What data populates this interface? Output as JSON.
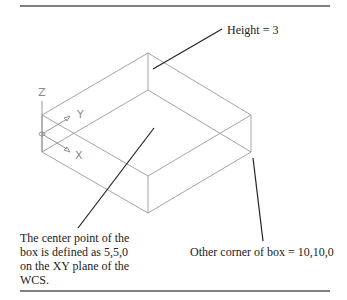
{
  "diagram": {
    "type": "isometric-box-wireframe",
    "colors": {
      "rule": "#555555",
      "box_edge": "#9a9a9a",
      "leader": "#222222",
      "axis": "#8a8a8a",
      "text": "#222222"
    },
    "ucs_icon": {
      "z_label": "Z",
      "y_label": "Y",
      "x_label": "X"
    },
    "annotations": {
      "height": "Height = 3",
      "center_line1": "The center point of the",
      "center_line2": "box is defined as 5,5,0",
      "center_line3": "on the XY plane of the",
      "center_line4": "WCS.",
      "other_corner": "Other corner of box = 10,10,0"
    }
  }
}
